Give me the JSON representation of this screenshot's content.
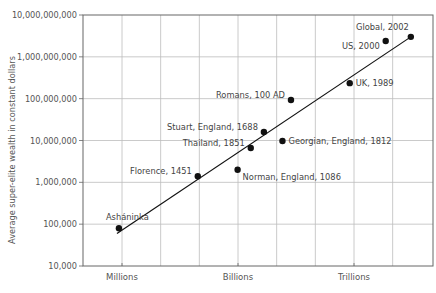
{
  "chart_data": {
    "type": "scatter",
    "title": "",
    "xlabel": "",
    "ylabel": "Average super-elite wealth in constant dollars",
    "y_scale": "log",
    "ylim": [
      10000,
      10000000000
    ],
    "y_ticks": [
      "10,000",
      "100,000",
      "1,000,000",
      "10,000,000",
      "100,000,000",
      "1,000,000,000",
      "10,000,000,000"
    ],
    "x_scale": "log",
    "x_ticks": [
      {
        "label": "Millions",
        "log": 6
      },
      {
        "label": "Billions",
        "log": 9
      },
      {
        "label": "Trillions",
        "log": 12
      }
    ],
    "xlim_log": [
      5,
      13
    ],
    "grid": true,
    "series": [
      {
        "name": "Societies",
        "points": [
          {
            "label": "Asháninka",
            "xlog": 5.92,
            "y": 80000,
            "label_pos": "above-right"
          },
          {
            "label": "Florence, 1451",
            "xlog": 7.96,
            "y": 1400000,
            "label_pos": "left"
          },
          {
            "label": "Norman, England, 1086",
            "xlog": 8.99,
            "y": 2000000,
            "label_pos": "right-below"
          },
          {
            "label": "Thailand, 1851",
            "xlog": 9.33,
            "y": 6600000,
            "label_pos": "left"
          },
          {
            "label": "Stuart, England, 1688",
            "xlog": 9.67,
            "y": 16000000,
            "label_pos": "left"
          },
          {
            "label": "Georgian, England, 1812",
            "xlog": 10.15,
            "y": 9700000,
            "label_pos": "right"
          },
          {
            "label": "Romans, 100 AD",
            "xlog": 10.37,
            "y": 93000000,
            "label_pos": "left"
          },
          {
            "label": "UK, 1989",
            "xlog": 11.89,
            "y": 235000000,
            "label_pos": "right"
          },
          {
            "label": "US, 2000",
            "xlog": 12.82,
            "y": 2400000000,
            "label_pos": "left-below"
          },
          {
            "label": "Global, 2002",
            "xlog": 13.47,
            "y": 3000000000,
            "label_pos": "above-left"
          }
        ]
      }
    ],
    "trend_line": {
      "from": {
        "xlog": 5.87,
        "y": 60000
      },
      "to": {
        "xlog": 13.47,
        "y": 3000000000
      }
    },
    "colors": {
      "points": "#111111",
      "line": "#111111",
      "grid": "#bdbdbd",
      "frame": "#666666",
      "text": "#555555"
    }
  }
}
